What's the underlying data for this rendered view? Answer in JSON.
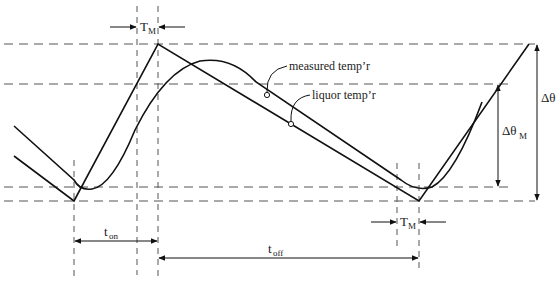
{
  "diagram": {
    "title": "",
    "labels": {
      "tm_top": {
        "main": "T",
        "sub": "M"
      },
      "tm_bottom": {
        "main": "T",
        "sub": "M"
      },
      "t_on": {
        "main": "t",
        "sub": "on"
      },
      "t_off": {
        "main": "t",
        "sub": "off"
      },
      "delta_theta": "Δθ",
      "delta_theta_m": {
        "main": "Δθ",
        "sub": "M"
      },
      "measured": "measured temp’r",
      "liquor": "liquor temp’r"
    },
    "colors": {
      "line": "#111111",
      "dashed": "#555555",
      "background": "#ffffff"
    },
    "series": [
      {
        "name": "liquor temp'r",
        "shape": "sawtooth",
        "points": [
          [
            14,
            156
          ],
          [
            74,
            201
          ],
          [
            158,
            44
          ],
          [
            419,
            201
          ],
          [
            529,
            44
          ]
        ]
      },
      {
        "name": "measured temp'r",
        "shape": "lagged-smooth"
      }
    ],
    "guides": {
      "horizontal_y": [
        44,
        84,
        187,
        201
      ],
      "vertical_x": [
        74,
        137,
        158,
        397,
        419
      ]
    }
  }
}
